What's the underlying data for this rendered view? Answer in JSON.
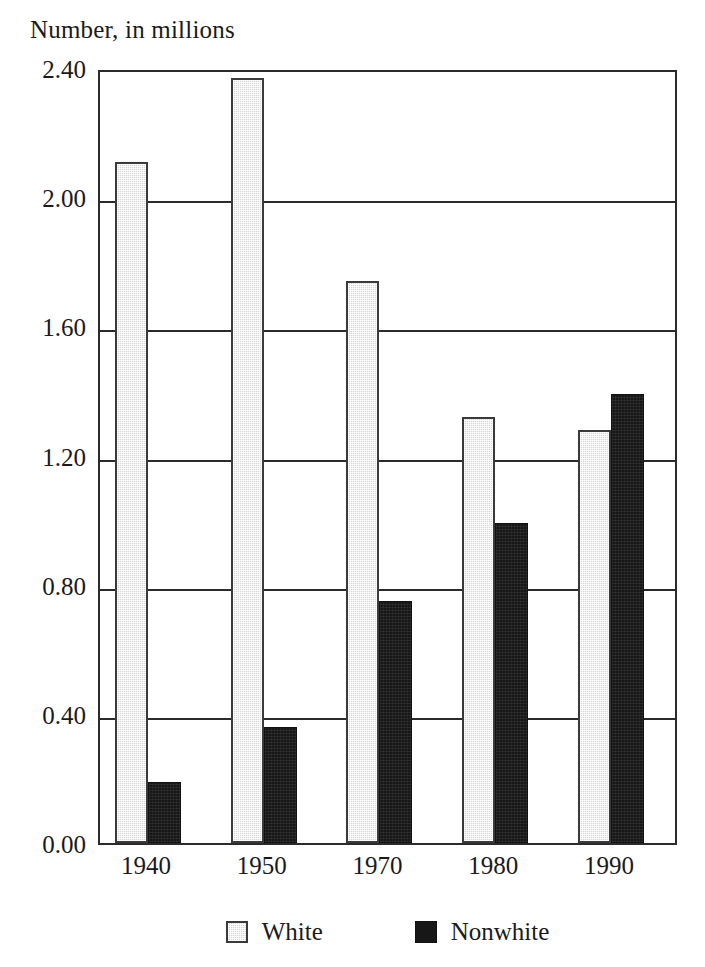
{
  "chart_data": {
    "type": "bar",
    "title": "Number, in millions",
    "xlabel": "",
    "ylabel": "Number, in millions",
    "categories": [
      "1940",
      "1950",
      "1970",
      "1980",
      "1990"
    ],
    "series": [
      {
        "name": "White",
        "values": [
          2.11,
          2.37,
          1.74,
          1.32,
          1.28
        ],
        "color": "#d6d6d6"
      },
      {
        "name": "Nonwhite",
        "values": [
          0.19,
          0.36,
          0.75,
          0.99,
          1.39
        ],
        "color": "#171717"
      }
    ],
    "ylim": [
      0.0,
      2.4
    ],
    "ytick_labels": [
      "0.00",
      "0.40",
      "0.80",
      "1.20",
      "1.60",
      "2.00",
      "2.40"
    ],
    "ytick_values": [
      0.0,
      0.4,
      0.8,
      1.2,
      1.6,
      2.0,
      2.4
    ],
    "grid": true,
    "grid_axis": "y",
    "legend_position": "bottom-center",
    "legend_entries": [
      "White",
      "Nonwhite"
    ],
    "bar_mode": "grouped",
    "annotations": []
  },
  "axis_colors": {
    "frame": "#2b2b2b",
    "gridline": "#2b2b2b",
    "text": "#1a1a1a"
  }
}
